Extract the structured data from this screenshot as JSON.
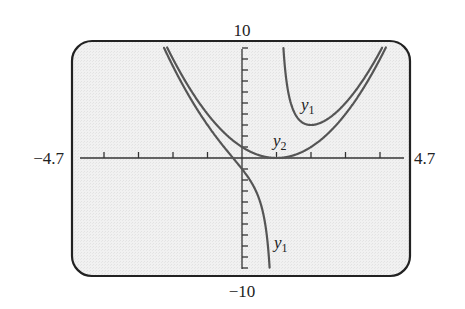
{
  "chart_data": {
    "type": "line",
    "title": "",
    "xlabel": "",
    "ylabel": "",
    "xlim": [
      -4.7,
      4.7
    ],
    "ylim": [
      -10,
      10
    ],
    "grid": false,
    "legend": "none (curves labeled inline)",
    "axis_labels": {
      "xmin": "−4.7",
      "xmax": "4.7",
      "ymin": "−10",
      "ymax": "10"
    },
    "x_tick_step": 1,
    "y_tick_step": 1,
    "series": [
      {
        "name": "y1",
        "formula": "y1 = (x - 1)^2 + 2/(x - 1)",
        "branches": [
          {
            "x": [
              -2.3,
              -2.0,
              -1.5,
              -1.0,
              -0.5,
              -0.26,
              0.0,
              0.2,
              0.4,
              0.5,
              0.6,
              0.7,
              0.75,
              0.8
            ],
            "y": [
              10.28,
              8.33,
              5.45,
              3.0,
              0.92,
              0.0,
              -1.0,
              -1.86,
              -2.97,
              -3.75,
              -4.84,
              -6.58,
              -7.94,
              -9.96
            ]
          },
          {
            "x": [
              1.2,
              1.3,
              1.4,
              1.5,
              1.75,
              2.0,
              2.5,
              3.0,
              3.5,
              4.0,
              4.12
            ],
            "y": [
              10.04,
              6.76,
              5.16,
              4.25,
              3.23,
              3.0,
              3.58,
              5.0,
              7.05,
              9.67,
              10.37
            ]
          }
        ],
        "labels": [
          {
            "text": "y",
            "sub": "1",
            "x": 2.0,
            "y": 4.5
          },
          {
            "text": "y",
            "sub": "1",
            "x": 0.9,
            "y": -7.5
          }
        ]
      },
      {
        "name": "y2",
        "formula": "y2 = (x - 1)^2",
        "x": [
          -2.16,
          -2.0,
          -1.5,
          -1.0,
          -0.5,
          0.0,
          0.5,
          1.0,
          1.5,
          2.0,
          2.5,
          3.0,
          3.5,
          4.0,
          4.16
        ],
        "y": [
          9.99,
          9.0,
          6.25,
          4.0,
          2.25,
          1.0,
          0.25,
          0.0,
          0.25,
          1.0,
          2.25,
          4.0,
          6.25,
          9.0,
          9.99
        ],
        "labels": [
          {
            "text": "y",
            "sub": "2",
            "x": 0.95,
            "y": 1.3
          }
        ]
      }
    ]
  },
  "style": {
    "frame_color": "#222222",
    "background": "#efefef",
    "curve_color": "#555555",
    "axis_color": "#333333"
  }
}
